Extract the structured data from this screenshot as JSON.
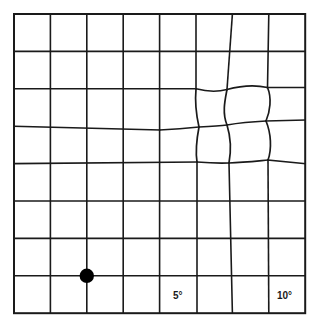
{
  "chart_type": "amsler-grid",
  "colors": {
    "background": "#ffffff",
    "grid_line": "#1a1a1a",
    "distortion_line": "#1a1a1a",
    "fixation_dot": "#000000",
    "label_text": "#1a1a1a"
  },
  "grid": {
    "columns": 8,
    "rows": 8,
    "x_lines": [
      14,
      50.4,
      86.8,
      123.2,
      159.6,
      196,
      232.4,
      268.8,
      305.2
    ],
    "y_lines": [
      14,
      51.4,
      88.8,
      126.2,
      163.6,
      201,
      238.4,
      275.8,
      313.2
    ],
    "left": 14,
    "top": 14,
    "right": 305.2,
    "bottom": 313.2,
    "cell_width": 36.4,
    "cell_height": 37.4,
    "line_width": 1.6,
    "border_width": 2.0
  },
  "fixation_dot": {
    "label": "fixation-dot",
    "cx": 86.8,
    "cy": 275.8,
    "r": 7.2
  },
  "labels": {
    "five_degrees": "5°",
    "ten_degrees": "10°"
  },
  "distortion": {
    "label": "metamorphopsia-region",
    "description": "pinched four-cell region with inward-warped grid lines",
    "bounds": {
      "x0": 196,
      "y0": 88.8,
      "x1": 268.8,
      "y1": 163.6
    },
    "nodes": {
      "top_left": [
        196,
        88.8
      ],
      "top_mid": [
        227,
        89.5
      ],
      "top_right": [
        267.5,
        87.5
      ],
      "mid_left": [
        199,
        127
      ],
      "center": [
        227,
        125
      ],
      "mid_right": [
        266,
        121
      ],
      "bottom_left": [
        197,
        162
      ],
      "bottom_mid": [
        229,
        163
      ],
      "bottom_right": [
        268,
        160
      ]
    },
    "edges": {
      "h_top_left": "M196,88.8 C208,92 218,92 227,89.5",
      "h_top_right": "M227,89.5 C240,86 256,85 267.5,87.5",
      "h_mid_left_outer": "M159.6,130 C172,129.5 186,128.5 199,127",
      "h_mid_left": "M199,127 C209,126.5 219,126 227,125",
      "h_mid_right": "M227,125 C241,122.5 255,121.5 266,121",
      "h_mid_right_outer": "M266,121 C277,120.7 292,120.3 305.2,120",
      "h_bot_left": "M197,162 C209,163 220,163.4 229,163",
      "h_bot_right": "M229,163 C243,162.5 257,161 268,160",
      "v_left_top": "M196,88.8 C195,100 196.5,116 199,127",
      "v_left_bot": "M199,127 C196.5,140 195.5,152 197,162",
      "v_mid_top": "M227,89.5 C225,100 222,113 227,125",
      "v_mid_bot": "M227,125 C231,138 231,152 229,163",
      "v_right_top": "M267.5,87.5 C272,98 270,112 266,121",
      "v_right_bot": "M266,121 C271,133 272,149 268,160"
    }
  }
}
